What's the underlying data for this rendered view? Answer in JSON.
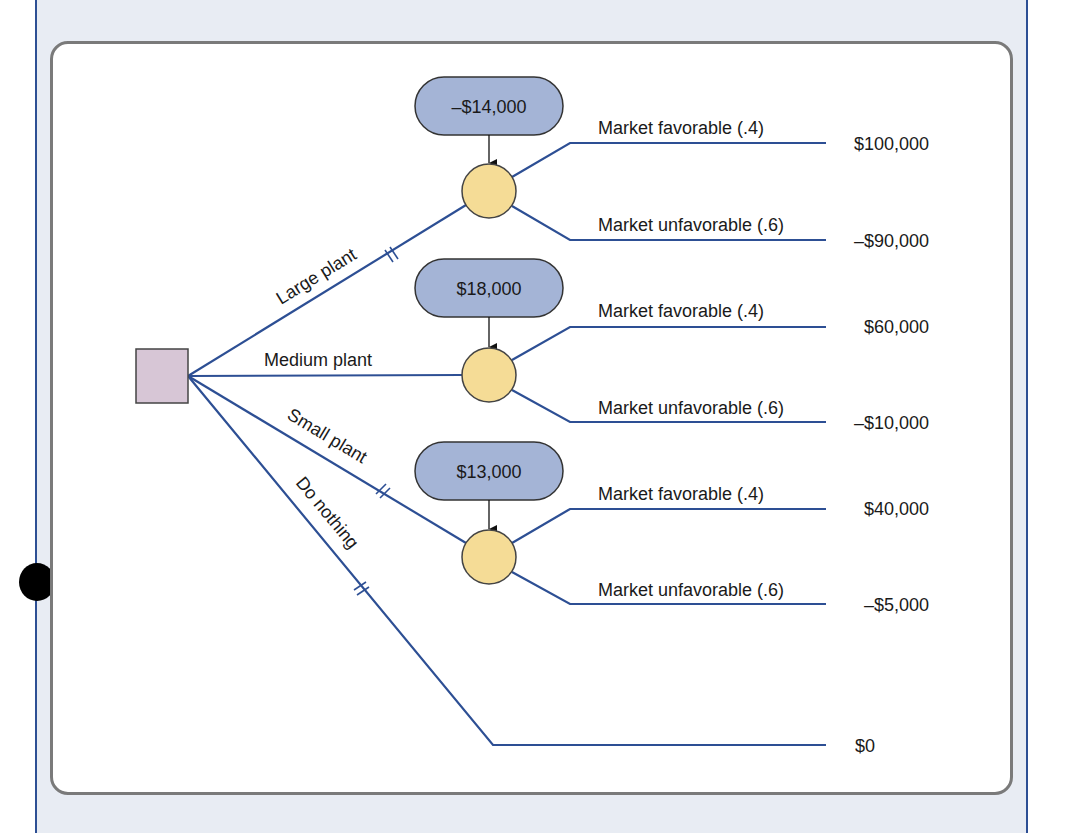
{
  "diagram": {
    "type": "decision-tree",
    "colors": {
      "panel_bg": "#e8ecf3",
      "panel_border": "#2d4f94",
      "card_border": "#7a7a7a",
      "branch_line": "#2d4f94",
      "decision_node_fill": "#d7c6d6",
      "chance_node_fill": "#f5dc96",
      "cost_pill_fill": "#a4b4d6"
    },
    "decision_node": {
      "label": ""
    },
    "alternatives": [
      {
        "label": "Large plant",
        "cost": "–$14,000",
        "outcomes": [
          {
            "label": "Market favorable (.4)",
            "payoff": "$100,000"
          },
          {
            "label": "Market unfavorable (.6)",
            "payoff": "–$90,000"
          }
        ]
      },
      {
        "label": "Medium plant",
        "cost": "$18,000",
        "outcomes": [
          {
            "label": "Market favorable (.4)",
            "payoff": "$60,000"
          },
          {
            "label": "Market unfavorable (.6)",
            "payoff": "–$10,000"
          }
        ]
      },
      {
        "label": "Small plant",
        "cost": "$13,000",
        "outcomes": [
          {
            "label": "Market favorable (.4)",
            "payoff": "$40,000"
          },
          {
            "label": "Market unfavorable (.6)",
            "payoff": "–$5,000"
          }
        ]
      },
      {
        "label": "Do nothing",
        "payoff": "$0"
      }
    ]
  }
}
